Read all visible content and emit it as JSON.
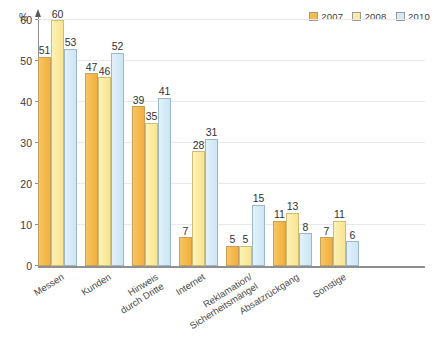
{
  "chart_data": {
    "type": "bar",
    "title": "",
    "xlabel": "",
    "ylabel": "%",
    "ylim": [
      0,
      60
    ],
    "yticks": [
      0,
      10,
      20,
      30,
      40,
      50,
      60
    ],
    "grid": true,
    "legend_position": "top-right",
    "categories": [
      "Messen",
      "Kunden",
      "Hinweis durch Dritte",
      "Internet",
      "Reklamation/ Sicherheitsmängel",
      "Absatzrückgang",
      "Sonstige"
    ],
    "category_lines": [
      [
        "Messen"
      ],
      [
        "Kunden"
      ],
      [
        "Hinweis",
        "durch Dritte"
      ],
      [
        "Internet"
      ],
      [
        "Reklamation/",
        "Sicherheitsmängel"
      ],
      [
        "Absatzrückgang"
      ],
      [
        "Sonstige"
      ]
    ],
    "series": [
      {
        "name": "2007",
        "color": "#f5bb4e",
        "values": [
          51,
          47,
          39,
          7,
          5,
          11,
          7
        ]
      },
      {
        "name": "2008",
        "color": "#fbeba2",
        "values": [
          60,
          46,
          35,
          28,
          5,
          13,
          11
        ]
      },
      {
        "name": "2010",
        "color": "#d7ebf7",
        "values": [
          53,
          52,
          41,
          31,
          15,
          8,
          6
        ]
      }
    ]
  },
  "axis": {
    "unit_label": "%",
    "tick_labels": [
      "0",
      "10",
      "20",
      "30",
      "40",
      "50",
      "60"
    ]
  },
  "legend": {
    "entries": [
      {
        "label": "2007",
        "color": "#f5bb4e"
      },
      {
        "label": "2008",
        "color": "#fbeba2"
      },
      {
        "label": "2010",
        "color": "#d7ebf7"
      }
    ]
  }
}
